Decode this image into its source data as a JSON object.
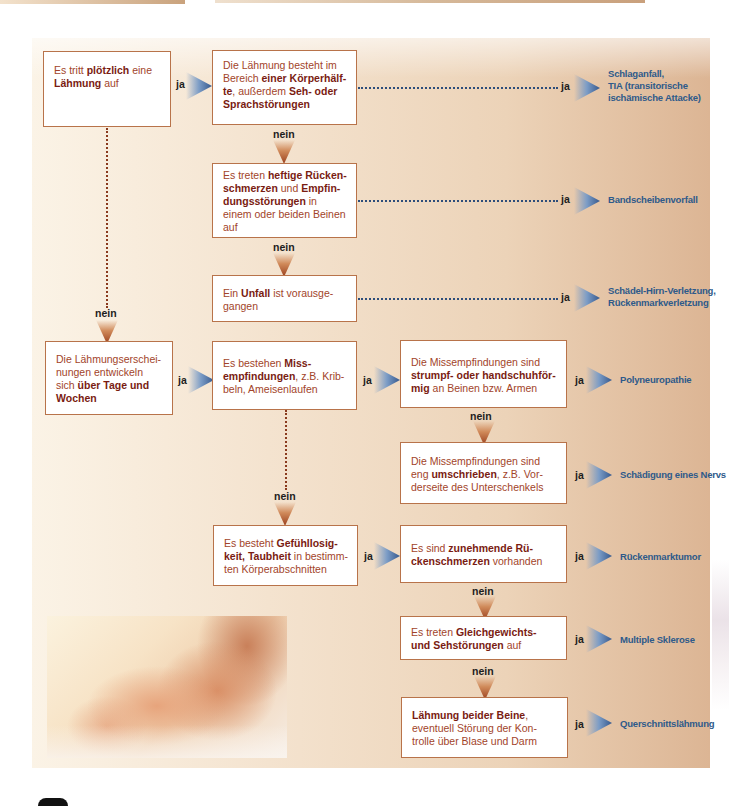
{
  "colors": {
    "box_text": "#a2442a",
    "box_bold": "#7a1c12",
    "box_border": "#b8734a",
    "result_text": "#2e5a8a",
    "label_text": "#1d1d1d",
    "arrow_right": "#5a7fb0",
    "arrow_down": "#9a3f1d",
    "panel_bg_start": "#fbf3e6",
    "panel_bg_end": "#dcb594"
  },
  "labels": {
    "yes": "ja",
    "no": "nein"
  },
  "nodes": {
    "a": {
      "p1": "Es tritt ",
      "b1": "plötzlich",
      "p2": " eine ",
      "b2": "Lähmung",
      "p3": " auf"
    },
    "b": {
      "p1": "Die Lähmung besteht im Bereich ",
      "b1": "einer Körperhälf-te",
      "p2": ", außerdem ",
      "b2": "Seh- oder Sprachstörungen"
    },
    "c": {
      "p1": "Es treten ",
      "b1": "heftige Rücken-schmerzen",
      "p2": " und ",
      "b2": "Empfin-dungsstörungen",
      "p3": " in einem oder beiden Beinen auf"
    },
    "d": {
      "p1": "Ein ",
      "b1": "Unfall",
      "p2": " ist vorausge-gangen"
    },
    "e": {
      "p1": "Die Lähmungserschei-nungen entwickeln sich ",
      "b1": "über Tage und Wochen"
    },
    "f": {
      "p1": "Es bestehen ",
      "b1": "Miss-empfindungen",
      "p2": ", z.B. Krib-beln, Ameisenlaufen"
    },
    "g": {
      "p1": "Die Missempfindungen sind ",
      "b1": "strumpf- oder handschuhför-mig",
      "p2": " an Beinen bzw. Armen"
    },
    "h": {
      "p1": "Die Missempfindungen sind eng ",
      "b1": "umschrieben",
      "p2": ", z.B. Vor-derseite des Unterschenkels"
    },
    "i": {
      "p1": "Es besteht ",
      "b1": "Gefühllosig-keit, Taubheit",
      "p2": " in bestimm-ten Körperabschnitten"
    },
    "j": {
      "p1": "Es sind ",
      "b1": "zunehmende Rü-ckenschmerzen",
      "p2": " vorhanden"
    },
    "k": {
      "p1": "Es treten ",
      "b1": "Gleichgewichts- und Sehstörungen",
      "p2": " auf"
    },
    "l": {
      "b1": "Lähmung beider Beine",
      "p1": ", eventuell Störung der Kon-trolle über Blase und Darm"
    }
  },
  "results": {
    "b": "Schlaganfall, TIA (transitorische ischämische Attacke)",
    "c": "Bandscheibenvorfall",
    "d": "Schädel-Hirn-Verletzung, Rückenmarkverletzung",
    "g": "Polyneuropathie",
    "h": "Schädigung eines Nervs",
    "j": "Rückenmarktumor",
    "k": "Multiple Sklerose",
    "l": "Querschnittslähmung"
  },
  "results_lines": {
    "b": [
      "Schlaganfall,",
      "TIA (transitorische",
      "ischämische Attacke)"
    ],
    "d": [
      "Schädel-Hirn-Verletzung,",
      "Rückenmarkverletzung"
    ]
  },
  "photo": {
    "subject": "feet-massage-photo"
  }
}
